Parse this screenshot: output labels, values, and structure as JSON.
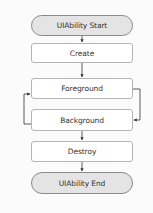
{
  "diagram": {
    "type": "flowchart",
    "nodes": [
      {
        "id": "start",
        "label": "UIAbility Start",
        "shape": "terminal"
      },
      {
        "id": "create",
        "label": "Create",
        "shape": "process"
      },
      {
        "id": "foreground",
        "label": "Foreground",
        "shape": "process"
      },
      {
        "id": "background",
        "label": "Background",
        "shape": "process"
      },
      {
        "id": "destroy",
        "label": "Destroy",
        "shape": "process"
      },
      {
        "id": "end",
        "label": "UIAbility End",
        "shape": "terminal"
      }
    ],
    "edges": [
      {
        "from": "start",
        "to": "create"
      },
      {
        "from": "create",
        "to": "foreground"
      },
      {
        "from": "foreground",
        "to": "background",
        "route": "right-loop"
      },
      {
        "from": "background",
        "to": "foreground",
        "route": "left-loop"
      },
      {
        "from": "background",
        "to": "destroy"
      },
      {
        "from": "destroy",
        "to": "end"
      }
    ],
    "colors": {
      "terminal_fill": "#e4e4e4",
      "terminal_border": "#8a8a8a",
      "process_fill": "#ffffff",
      "process_border": "#b5b5b5",
      "edge": "#333333",
      "text": "#333333"
    }
  }
}
